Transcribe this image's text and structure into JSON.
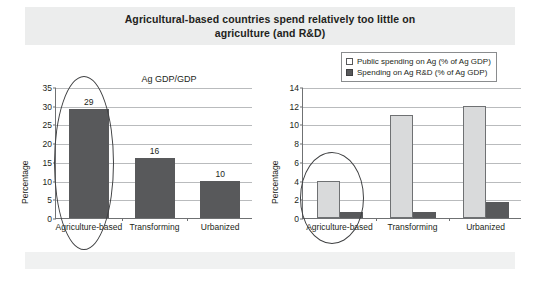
{
  "slide": {
    "title": "Agricultural-based countries spend relatively too little on agriculture (and R&D)",
    "title_line1": "Agricultural-based countries spend relatively too little on",
    "title_line2": "agriculture (and R&D)"
  },
  "legend": {
    "items": [
      {
        "label": "Public spending on Ag (% of Ag GDP)",
        "swatch": "light",
        "color": "#ffffff"
      },
      {
        "label": "Spending on Ag R&D (% of Ag GDP)",
        "swatch": "dark",
        "color": "#58595b"
      }
    ]
  },
  "annotations": [
    {
      "name": "highlight-ellipse-left",
      "target": "Agriculture-based bar in Ag GDP/GDP chart"
    },
    {
      "name": "highlight-ellipse-right",
      "target": "Agriculture-based group in spending chart"
    }
  ],
  "chart_data": [
    {
      "id": "left",
      "type": "bar",
      "title": "Ag GDP/GDP",
      "xlabel": "",
      "ylabel": "Percentage",
      "categories": [
        "Agriculture-based",
        "Transforming",
        "Urbanized"
      ],
      "values": [
        29,
        16,
        10
      ],
      "data_labels": [
        "29",
        "16",
        "10"
      ],
      "yticks": [
        0,
        5,
        10,
        15,
        20,
        25,
        30,
        35
      ],
      "ytick_labels": [
        "0",
        "5",
        "10",
        "15",
        "20",
        "25",
        "30",
        "35"
      ],
      "ylim": [
        0,
        35
      ],
      "grid": true,
      "legend_position": "none",
      "series_color": "#58595b"
    },
    {
      "id": "right",
      "type": "bar",
      "title": "",
      "xlabel": "",
      "ylabel": "Percentage",
      "categories": [
        "Agriculture-based",
        "Transforming",
        "Urbanized"
      ],
      "series": [
        {
          "name": "Public spending on Ag (% of Ag GDP)",
          "values": [
            4.0,
            11.0,
            12.0
          ],
          "color": "#d9dadb"
        },
        {
          "name": "Spending on Ag R&D (% of Ag GDP)",
          "values": [
            0.6,
            0.6,
            1.75
          ],
          "color": "#58595b"
        }
      ],
      "yticks": [
        0,
        2,
        4,
        6,
        8,
        10,
        12,
        14
      ],
      "ytick_labels": [
        "0",
        "2",
        "4",
        "6",
        "8",
        "10",
        "12",
        "14"
      ],
      "ylim": [
        0,
        14
      ],
      "grid": true,
      "legend_position": "top-right"
    }
  ]
}
